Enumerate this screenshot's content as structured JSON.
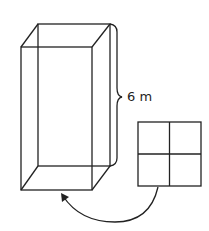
{
  "diagram": {
    "prism_label": "6 m",
    "stroke_color": "#222222",
    "background": "#ffffff",
    "grid": {
      "rows": 2,
      "cols": 2
    }
  }
}
